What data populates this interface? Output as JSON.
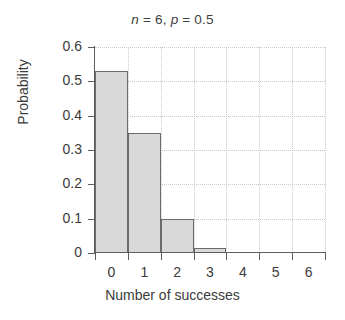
{
  "chart_data": {
    "type": "bar",
    "title": "n = 6, p = 0.5",
    "title_parts": {
      "n_symbol": "n",
      "n_eq": " = 6, ",
      "p_symbol": "p",
      "p_eq": " = 0.5"
    },
    "xlabel": "Number of successes",
    "ylabel": "Probability",
    "categories": [
      0,
      1,
      2,
      3,
      4,
      5,
      6
    ],
    "values": [
      0.53,
      0.35,
      0.1,
      0.016,
      0,
      0,
      0
    ],
    "xlim": [
      -0.5,
      6.5
    ],
    "ylim": [
      0,
      0.6
    ],
    "xticks": [
      0,
      1,
      2,
      3,
      4,
      5,
      6
    ],
    "xtick_labels": [
      "0",
      "1",
      "2",
      "3",
      "4",
      "5",
      "6"
    ],
    "yticks": [
      0,
      0.1,
      0.2,
      0.3,
      0.4,
      0.5,
      0.6
    ],
    "ytick_labels": [
      "0",
      "0.1",
      "0.2",
      "0.3",
      "0.4",
      "0.5",
      "0.6"
    ],
    "grid": true,
    "grid_color": "#c9c9c9",
    "bar_fill": "#d9d9d9",
    "bar_edge": "#6a6a6a",
    "bar_width": 1,
    "legend": null,
    "background": "#ffffff"
  }
}
